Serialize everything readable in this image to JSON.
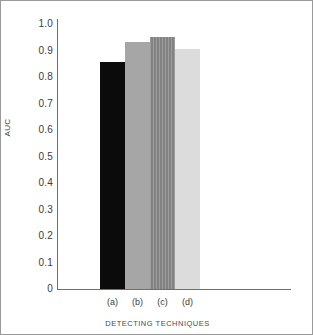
{
  "chart_data": {
    "type": "bar",
    "title": "",
    "subtitle": "",
    "xlabel": "DETECTING TECHNIQUES",
    "ylabel": "AUC",
    "categories": [
      "(a)",
      "(b)",
      "(c)",
      "(d)"
    ],
    "values": [
      0.84,
      0.915,
      0.935,
      0.89
    ],
    "series": [
      {
        "name": "AUC",
        "values": [
          0.84,
          0.915,
          0.935,
          0.89
        ]
      }
    ],
    "ylim": [
      0,
      1.0
    ],
    "ytick_labels": [
      "1.0",
      "0.9",
      "0.8",
      "0.7",
      "0.6",
      "0.5",
      "0.4",
      "0.3",
      "0.2",
      "0.1",
      "0"
    ],
    "ytick_values": [
      1.0,
      0.9,
      0.8,
      0.7,
      0.6,
      0.5,
      0.4,
      0.3,
      0.2,
      0.1,
      0
    ],
    "grid": false,
    "legend": null,
    "legend_position": "none",
    "annotations": [],
    "bar_colors": [
      "#0b0b0b",
      "#a6a6a6",
      "#8a8a8a",
      "#dcdcdc"
    ],
    "bar_patterns": [
      "solid",
      "solid",
      "vertical-hatch",
      "solid"
    ],
    "axis_color": "#6e6e6e",
    "text_color": "#3c3c3c",
    "background_color": "#ffffff",
    "border_color": "#9a9a9a"
  }
}
